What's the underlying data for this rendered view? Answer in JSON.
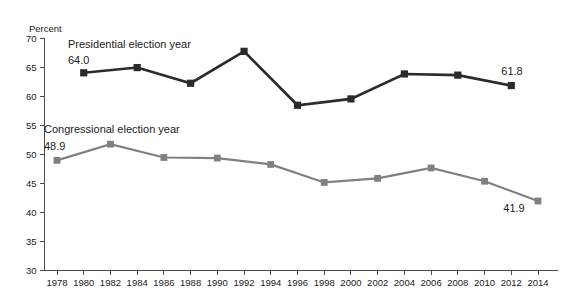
{
  "chart_data": {
    "type": "line",
    "title": "",
    "xlabel": "",
    "ylabel": "Percent",
    "ylim": [
      30,
      70
    ],
    "ytick_step": 5,
    "yticks": [
      30,
      35,
      40,
      45,
      50,
      55,
      60,
      65,
      70
    ],
    "xlim": [
      1978,
      2014
    ],
    "xticks": [
      1978,
      1980,
      1982,
      1984,
      1986,
      1988,
      1990,
      1992,
      1994,
      1996,
      1998,
      2000,
      2002,
      2004,
      2006,
      2008,
      2010,
      2012,
      2014
    ],
    "grid": false,
    "legend_position": "inline-annotation",
    "series": [
      {
        "name": "Presidential election year",
        "color": "#2b2b2b",
        "marker": "square",
        "x": [
          1980,
          1984,
          1988,
          1992,
          1996,
          2000,
          2004,
          2008,
          2012
        ],
        "values": [
          64.0,
          64.9,
          62.2,
          67.7,
          58.4,
          59.5,
          63.8,
          63.6,
          61.8
        ],
        "start_label": "64.0",
        "end_label": "61.8"
      },
      {
        "name": "Congressional election year",
        "color": "#808080",
        "marker": "square",
        "x": [
          1978,
          1982,
          1986,
          1990,
          1994,
          1998,
          2002,
          2006,
          2010,
          2014
        ],
        "values": [
          48.9,
          51.7,
          49.4,
          49.3,
          48.2,
          45.1,
          45.8,
          47.6,
          45.3,
          41.9
        ],
        "start_label": "48.9",
        "end_label": "41.9"
      }
    ],
    "annotations": [
      {
        "text": "Presidential election year",
        "series": 0
      },
      {
        "text": "64.0",
        "series": 0
      },
      {
        "text": "61.8",
        "series": 0
      },
      {
        "text": "Congressional election year",
        "series": 1
      },
      {
        "text": "48.9",
        "series": 1
      },
      {
        "text": "41.9",
        "series": 1
      }
    ]
  },
  "axis": {
    "y_title": "Percent",
    "y_labels": [
      "70",
      "65",
      "60",
      "55",
      "50",
      "45",
      "40",
      "35",
      "30"
    ],
    "x_labels": [
      "1978",
      "1980",
      "1982",
      "1984",
      "1986",
      "1988",
      "1990",
      "1992",
      "1994",
      "1996",
      "1998",
      "2000",
      "2002",
      "2004",
      "2006",
      "2008",
      "2010",
      "2012",
      "2014"
    ]
  },
  "labels": {
    "presidential_series": "Presidential election year",
    "presidential_start_value": "64.0",
    "presidential_end_value": "61.8",
    "congressional_series": "Congressional election year",
    "congressional_start_value": "48.9",
    "congressional_end_value": "41.9"
  },
  "colors": {
    "presidential": "#2b2b2b",
    "congressional": "#808080",
    "axis": "#4a4a4a",
    "background": "#ffffff",
    "text": "#1a1a1a"
  }
}
